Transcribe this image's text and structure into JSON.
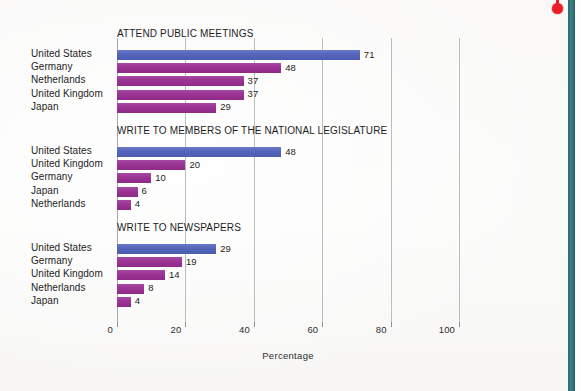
{
  "decorations": {
    "edge_bar_color": "#2b6a72",
    "dot_color": "#e8202a",
    "background_color": "#fbfafa"
  },
  "chart_data": {
    "type": "bar",
    "orientation": "horizontal",
    "title": "",
    "xlabel": "Percentage",
    "ylabel": "",
    "xlim": [
      0,
      100
    ],
    "xticks": [
      0,
      20,
      40,
      60,
      80,
      100
    ],
    "xticklabels": [
      "0",
      "20",
      "40",
      "60",
      "80",
      "100"
    ],
    "grid": true,
    "grid_axis": "x",
    "legend": "none",
    "colors": {
      "highlight": "#5566bb",
      "default": "#9c3494"
    },
    "panels": [
      {
        "title": "ATTEND PUBLIC MEETINGS",
        "categories": [
          "United States",
          "Germany",
          "Netherlands",
          "United Kingdom",
          "Japan"
        ],
        "values": [
          71,
          48,
          37,
          37,
          29
        ],
        "value_labels": [
          "71",
          "48",
          "37",
          "37",
          "29"
        ],
        "bar_colors": [
          "#5566bb",
          "#9c3494",
          "#9c3494",
          "#9c3494",
          "#9c3494"
        ]
      },
      {
        "title": "WRITE TO MEMBERS OF THE NATIONAL LEGISLATURE",
        "categories": [
          "United States",
          "United Kingdom",
          "Germany",
          "Japan",
          "Netherlands"
        ],
        "values": [
          48,
          20,
          10,
          6,
          4
        ],
        "value_labels": [
          "48",
          "20",
          "10",
          "6",
          "4"
        ],
        "bar_colors": [
          "#5566bb",
          "#9c3494",
          "#9c3494",
          "#9c3494",
          "#9c3494"
        ]
      },
      {
        "title": "WRITE TO NEWSPAPERS",
        "categories": [
          "United States",
          "Germany",
          "United Kingdom",
          "Netherlands",
          "Japan"
        ],
        "values": [
          29,
          19,
          14,
          8,
          4
        ],
        "value_labels": [
          "29",
          "19",
          "14",
          "8",
          "4"
        ],
        "bar_colors": [
          "#5566bb",
          "#9c3494",
          "#9c3494",
          "#9c3494",
          "#9c3494"
        ]
      }
    ]
  }
}
